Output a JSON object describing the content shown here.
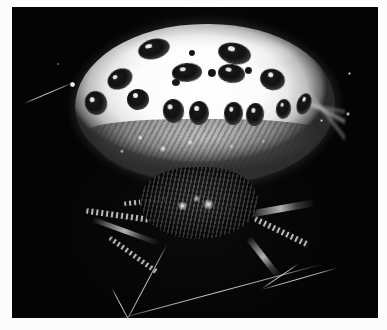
{
  "image": {
    "subject": "spider",
    "common_name": "orb-weaver spider",
    "description": "Close-up photograph of a spider with a large pale white abdomen covered in dark round spots, resting on its web against a black background",
    "medium": "black and white photograph",
    "background_color": "#040404",
    "paper_color": "#fcfcfc",
    "abdomen_color": "#ffffff",
    "spot_color": "#111111",
    "strand_color": "#e6e6e6",
    "photo_bounds": {
      "left": 12,
      "top": 7,
      "width": 366,
      "height": 311
    }
  },
  "subject_parts": {
    "abdomen_label": "abdomen",
    "cephalothorax_label": "cephalothorax",
    "legs_label": "legs",
    "web_label": "web strands",
    "hair_label": "dorsal hair fringe",
    "texture_label": "ventral granular texture"
  },
  "spots": [
    {
      "name": "dorsal-spot-1",
      "x": 126,
      "y": 32,
      "w": 32,
      "h": 20,
      "rot": -14
    },
    {
      "name": "dorsal-spot-2",
      "x": 206,
      "y": 36,
      "w": 33,
      "h": 21,
      "rot": 12
    },
    {
      "name": "dorsal-spot-3",
      "x": 95,
      "y": 62,
      "w": 26,
      "h": 20,
      "rot": -28
    },
    {
      "name": "dorsal-spot-4",
      "x": 160,
      "y": 56,
      "w": 30,
      "h": 19,
      "rot": -4
    },
    {
      "name": "dorsal-spot-5",
      "x": 206,
      "y": 57,
      "w": 27,
      "h": 19,
      "rot": 8
    },
    {
      "name": "dorsal-spot-6",
      "x": 248,
      "y": 62,
      "w": 25,
      "h": 21,
      "rot": 16
    },
    {
      "name": "mid-spot-1",
      "x": 115,
      "y": 82,
      "w": 22,
      "h": 21,
      "rot": 0
    },
    {
      "name": "mid-spot-2",
      "x": 151,
      "y": 92,
      "w": 21,
      "h": 24,
      "rot": -6
    },
    {
      "name": "mid-spot-3",
      "x": 177,
      "y": 94,
      "w": 20,
      "h": 24,
      "rot": 2
    },
    {
      "name": "mid-spot-4",
      "x": 212,
      "y": 95,
      "w": 19,
      "h": 23,
      "rot": 4
    },
    {
      "name": "mid-spot-5",
      "x": 234,
      "y": 96,
      "w": 18,
      "h": 23,
      "rot": 6
    },
    {
      "name": "mid-spot-6",
      "x": 264,
      "y": 92,
      "w": 15,
      "h": 20,
      "rot": 8
    },
    {
      "name": "mid-spot-7",
      "x": 285,
      "y": 86,
      "w": 14,
      "h": 22,
      "rot": 20
    },
    {
      "name": "flank-spot-left",
      "x": 73,
      "y": 84,
      "w": 22,
      "h": 24,
      "rot": -20
    },
    {
      "name": "micro-spot-1",
      "x": 160,
      "y": 72,
      "w": 8,
      "h": 7,
      "rot": 0
    },
    {
      "name": "micro-spot-2",
      "x": 196,
      "y": 62,
      "w": 8,
      "h": 8,
      "rot": 0
    },
    {
      "name": "micro-spot-3",
      "x": 233,
      "y": 60,
      "w": 7,
      "h": 7,
      "rot": 0
    },
    {
      "name": "micro-spot-4",
      "x": 177,
      "y": 43,
      "w": 6,
      "h": 6,
      "rot": 0
    }
  ],
  "web_strands": [
    {
      "name": "strand-upper-left",
      "x": 12,
      "y": 96,
      "len": 52,
      "rot": -23
    },
    {
      "name": "strand-bottom-long",
      "x": 104,
      "y": 312,
      "len": 214,
      "rot": -15
    },
    {
      "name": "strand-bottom-left-diagonal",
      "x": 112,
      "y": 318,
      "len": 92,
      "rot": -62
    },
    {
      "name": "strand-bottom-left-branch",
      "x": 100,
      "y": 281,
      "len": 40,
      "rot": 62
    },
    {
      "name": "strand-right-anchor",
      "x": 250,
      "y": 282,
      "len": 78,
      "rot": -16
    },
    {
      "name": "strand-right-leg-tip",
      "x": 250,
      "y": 281,
      "len": 44,
      "rot": -34
    }
  ],
  "legs": [
    {
      "name": "leg-front-left",
      "x": 74,
      "y": 206,
      "w": 74,
      "h": 6,
      "rot": 8
    },
    {
      "name": "leg-mid-left",
      "x": 78,
      "y": 222,
      "w": 72,
      "h": 5,
      "rot": 20
    },
    {
      "name": "leg-rear-left",
      "x": 92,
      "y": 246,
      "w": 60,
      "h": 5,
      "rot": 36
    },
    {
      "name": "leg-front-right",
      "x": 236,
      "y": 198,
      "w": 68,
      "h": 7,
      "rot": -10
    },
    {
      "name": "leg-mid-right",
      "x": 240,
      "y": 222,
      "w": 60,
      "h": 6,
      "rot": 26
    },
    {
      "name": "leg-rear-right",
      "x": 226,
      "y": 248,
      "w": 52,
      "h": 6,
      "rot": 52
    },
    {
      "name": "pedipalp-left",
      "x": 112,
      "y": 192,
      "w": 44,
      "h": 5,
      "rot": -6
    }
  ],
  "highlights": [
    {
      "name": "web-bead-upper-left",
      "x": 58,
      "y": 75,
      "size": 5
    },
    {
      "name": "fleck-right-upper",
      "x": 336,
      "y": 65,
      "size": 3
    },
    {
      "name": "fleck-right-mid",
      "x": 334,
      "y": 105,
      "size": 4
    },
    {
      "name": "fleck-top-left",
      "x": 45,
      "y": 56,
      "size": 2
    },
    {
      "name": "fleck-abdomen-rim",
      "x": 308,
      "y": 112,
      "size": 3
    }
  ]
}
